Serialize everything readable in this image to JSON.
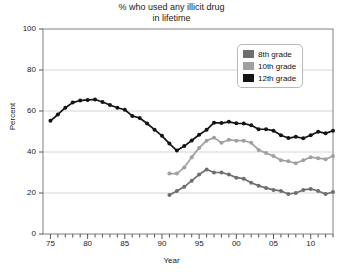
{
  "chart_data": {
    "type": "line",
    "title": "% who used any illicit drug\nin lifetime",
    "title_line1": "% who used any illicit drug",
    "title_line2": "in lifetime",
    "xlabel": "Year",
    "ylabel": "Percent",
    "ylim": [
      0,
      100
    ],
    "yticks": [
      0,
      20,
      40,
      60,
      80,
      100
    ],
    "ytick_labels": [
      "0",
      "20",
      "40",
      "60",
      "80",
      "100"
    ],
    "xlim": [
      1974,
      2013
    ],
    "xticks": [
      1975,
      1980,
      1985,
      1990,
      1995,
      2000,
      2005,
      2010
    ],
    "xtick_labels": [
      "75",
      "80",
      "85",
      "90",
      "95",
      "00",
      "05",
      "10"
    ],
    "grid": "horizontal",
    "legend_position": "top-right",
    "markers": true,
    "series": [
      {
        "name": "8th grade",
        "color": "#6e6e6e",
        "x": [
          1991,
          1992,
          1993,
          1994,
          1995,
          1996,
          1997,
          1998,
          1999,
          2000,
          2001,
          2002,
          2003,
          2004,
          2005,
          2006,
          2007,
          2008,
          2009,
          2010,
          2011,
          2012,
          2013
        ],
        "values": [
          19.0,
          21.0,
          23.0,
          26.0,
          29.0,
          31.5,
          30.0,
          30.0,
          29.0,
          27.5,
          27.0,
          25.0,
          23.5,
          22.5,
          21.5,
          21.0,
          19.5,
          20.0,
          21.5,
          22.0,
          21.0,
          19.5,
          20.5
        ]
      },
      {
        "name": "10th grade",
        "color": "#a0a0a0",
        "x": [
          1991,
          1992,
          1993,
          1994,
          1995,
          1996,
          1997,
          1998,
          1999,
          2000,
          2001,
          2002,
          2003,
          2004,
          2005,
          2006,
          2007,
          2008,
          2009,
          2010,
          2011,
          2012,
          2013
        ],
        "values": [
          29.5,
          29.5,
          32.5,
          37.5,
          42.0,
          45.5,
          47.0,
          44.5,
          46.0,
          45.5,
          45.5,
          44.5,
          41.0,
          39.5,
          38.0,
          36.0,
          35.5,
          34.5,
          36.0,
          37.5,
          37.0,
          36.5,
          38.0
        ]
      },
      {
        "name": "12th grade",
        "color": "#141414",
        "x": [
          1975,
          1976,
          1977,
          1978,
          1979,
          1980,
          1981,
          1982,
          1983,
          1984,
          1985,
          1986,
          1987,
          1988,
          1989,
          1990,
          1991,
          1992,
          1993,
          1994,
          1995,
          1996,
          1997,
          1998,
          1999,
          2000,
          2001,
          2002,
          2003,
          2004,
          2005,
          2006,
          2007,
          2008,
          2009,
          2010,
          2011,
          2012,
          2013
        ],
        "values": [
          55.2,
          58.3,
          61.6,
          64.1,
          65.1,
          65.4,
          65.6,
          64.4,
          62.9,
          61.6,
          60.6,
          57.6,
          56.6,
          53.9,
          50.9,
          47.9,
          44.1,
          40.7,
          42.9,
          45.6,
          48.4,
          50.8,
          54.3,
          54.1,
          54.7,
          54.0,
          53.9,
          53.0,
          51.1,
          51.1,
          50.4,
          48.2,
          46.8,
          47.4,
          46.7,
          48.2,
          49.9,
          49.1,
          50.4
        ]
      }
    ]
  },
  "legend": {
    "items": [
      {
        "label": "8th grade",
        "color": "#6e6e6e"
      },
      {
        "label": "10th grade",
        "color": "#a0a0a0"
      },
      {
        "label": "12th grade",
        "color": "#141414"
      }
    ]
  }
}
